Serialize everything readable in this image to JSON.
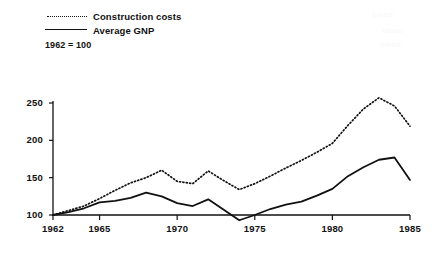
{
  "legend": {
    "entries": [
      {
        "label": "Construction costs",
        "style": "dotted",
        "color": "#111111"
      },
      {
        "label": "Average GNP",
        "style": "solid",
        "color": "#111111"
      }
    ]
  },
  "base_note": "1962 = 100",
  "chart_data": {
    "type": "line",
    "title": "",
    "subtitle": "",
    "xlabel": "",
    "ylabel": "",
    "note": "1962 = 100",
    "xlim": [
      1962,
      1985
    ],
    "ylim": [
      90,
      262
    ],
    "yticks": [
      100,
      150,
      200,
      250
    ],
    "xticks": [
      1962,
      1965,
      1970,
      1975,
      1980,
      1985
    ],
    "xtick_labels": [
      "1962",
      "1965",
      "1970",
      "1975",
      "1980",
      "1985"
    ],
    "ytick_labels": [
      "100",
      "150",
      "200",
      "250"
    ],
    "grid": false,
    "legend_position": "top-left",
    "x": [
      1962,
      1963,
      1964,
      1965,
      1966,
      1967,
      1968,
      1969,
      1970,
      1971,
      1972,
      1973,
      1974,
      1975,
      1976,
      1977,
      1978,
      1979,
      1980,
      1981,
      1982,
      1983,
      1984,
      1985
    ],
    "series": [
      {
        "name": "Construction costs",
        "style": "dotted",
        "color": "#111111",
        "values": [
          100,
          106,
          112,
          122,
          133,
          143,
          150,
          160,
          145,
          142,
          159,
          146,
          134,
          142,
          152,
          163,
          173,
          184,
          196,
          220,
          242,
          257,
          246,
          219
        ]
      },
      {
        "name": "Average GNP",
        "style": "solid",
        "color": "#111111",
        "values": [
          100,
          104,
          109,
          117,
          119,
          123,
          130,
          125,
          116,
          112,
          121,
          107,
          93,
          100,
          108,
          114,
          118,
          126,
          135,
          152,
          164,
          174,
          177,
          147
        ]
      }
    ]
  },
  "artifacts": [
    {
      "text": "bleed",
      "left": 372,
      "top": 10
    },
    {
      "text": "bleed",
      "left": 382,
      "top": 26
    },
    {
      "text": "bleed",
      "left": 380,
      "top": 40
    }
  ]
}
